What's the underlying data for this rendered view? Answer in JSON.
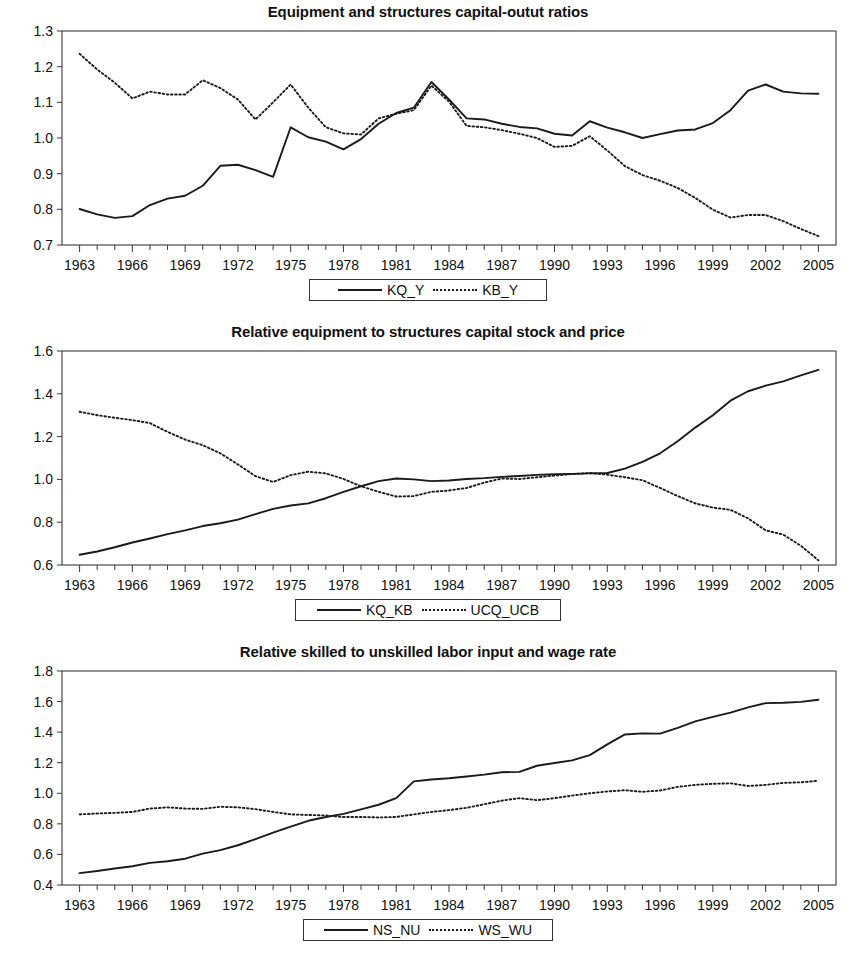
{
  "page": {
    "background": "#ffffff",
    "line_color": "#1a1a1a",
    "axis_color": "#3a3a3a"
  },
  "charts": [
    {
      "id": "chart-capital-output-ratios",
      "title": "Equipment and structures capital-outut ratios",
      "legend": [
        {
          "label": "KQ_Y",
          "style": "solid"
        },
        {
          "label": "KB_Y",
          "style": "dotted"
        }
      ],
      "y_ticks": [
        "0.7",
        "0.8",
        "0.9",
        "1.0",
        "1.1",
        "1.2",
        "1.3"
      ],
      "x_ticks": [
        "1963",
        "1966",
        "1969",
        "1972",
        "1975",
        "1978",
        "1981",
        "1984",
        "1987",
        "1990",
        "1993",
        "1996",
        "1999",
        "2002",
        "2005"
      ]
    },
    {
      "id": "chart-relative-capital-stock-price",
      "title": "Relative equipment to structures capital stock and price",
      "legend": [
        {
          "label": "KQ_KB",
          "style": "solid"
        },
        {
          "label": "UCQ_UCB",
          "style": "dotted"
        }
      ],
      "y_ticks": [
        "0.6",
        "0.8",
        "1.0",
        "1.2",
        "1.4",
        "1.6"
      ],
      "x_ticks": [
        "1963",
        "1966",
        "1969",
        "1972",
        "1975",
        "1978",
        "1981",
        "1984",
        "1987",
        "1990",
        "1993",
        "1996",
        "1999",
        "2002",
        "2005"
      ]
    },
    {
      "id": "chart-relative-labor-wage",
      "title": "Relative skilled to unskilled labor input and wage rate",
      "legend": [
        {
          "label": "NS_NU",
          "style": "solid"
        },
        {
          "label": "WS_WU",
          "style": "dotted"
        }
      ],
      "y_ticks": [
        "0.4",
        "0.6",
        "0.8",
        "1.0",
        "1.2",
        "1.4",
        "1.6",
        "1.8"
      ],
      "x_ticks": [
        "1963",
        "1966",
        "1969",
        "1972",
        "1975",
        "1978",
        "1981",
        "1984",
        "1987",
        "1990",
        "1993",
        "1996",
        "1999",
        "2002",
        "2005"
      ]
    }
  ],
  "chart_data": [
    {
      "type": "line",
      "title": "Equipment and structures capital-outut ratios",
      "xlabel": "",
      "ylabel": "",
      "xlim": [
        1962,
        2006
      ],
      "ylim": [
        0.7,
        1.3
      ],
      "grid": false,
      "legend_position": "bottom",
      "x": [
        1963,
        1964,
        1965,
        1966,
        1967,
        1968,
        1969,
        1970,
        1971,
        1972,
        1973,
        1974,
        1975,
        1976,
        1977,
        1978,
        1979,
        1980,
        1981,
        1982,
        1983,
        1984,
        1985,
        1986,
        1987,
        1988,
        1989,
        1990,
        1991,
        1992,
        1993,
        1994,
        1995,
        1996,
        1997,
        1998,
        1999,
        2000,
        2001,
        2002,
        2003,
        2004,
        2005
      ],
      "series": [
        {
          "name": "KQ_Y",
          "style": "solid",
          "values": [
            0.801,
            0.786,
            0.776,
            0.781,
            0.812,
            0.83,
            0.838,
            0.866,
            0.922,
            0.925,
            0.91,
            0.891,
            1.03,
            1.002,
            0.99,
            0.968,
            0.997,
            1.04,
            1.07,
            1.085,
            1.157,
            1.108,
            1.055,
            1.052,
            1.04,
            1.031,
            1.027,
            1.012,
            1.007,
            1.047,
            1.029,
            1.016,
            1.0,
            1.011,
            1.021,
            1.024,
            1.042,
            1.078,
            1.133,
            1.15,
            1.13,
            1.125,
            1.124
          ]
        },
        {
          "name": "KB_Y",
          "style": "dotted",
          "values": [
            1.236,
            1.192,
            1.155,
            1.111,
            1.13,
            1.122,
            1.122,
            1.162,
            1.14,
            1.108,
            1.052,
            1.1,
            1.15,
            1.085,
            1.03,
            1.013,
            1.01,
            1.055,
            1.068,
            1.078,
            1.147,
            1.102,
            1.034,
            1.03,
            1.022,
            1.012,
            1.0,
            0.975,
            0.978,
            1.005,
            0.965,
            0.921,
            0.896,
            0.88,
            0.86,
            0.832,
            0.799,
            0.777,
            0.784,
            0.784,
            0.767,
            0.745,
            0.725
          ]
        }
      ]
    },
    {
      "type": "line",
      "title": "Relative equipment to structures capital stock and price",
      "xlabel": "",
      "ylabel": "",
      "xlim": [
        1962,
        2006
      ],
      "ylim": [
        0.6,
        1.6
      ],
      "grid": false,
      "legend_position": "bottom",
      "x": [
        1963,
        1964,
        1965,
        1966,
        1967,
        1968,
        1969,
        1970,
        1971,
        1972,
        1973,
        1974,
        1975,
        1976,
        1977,
        1978,
        1979,
        1980,
        1981,
        1982,
        1983,
        1984,
        1985,
        1986,
        1987,
        1988,
        1989,
        1990,
        1991,
        1992,
        1993,
        1994,
        1995,
        1996,
        1997,
        1998,
        1999,
        2000,
        2001,
        2002,
        2003,
        2004,
        2005
      ],
      "series": [
        {
          "name": "KQ_KB",
          "style": "solid",
          "values": [
            0.648,
            0.663,
            0.683,
            0.705,
            0.724,
            0.744,
            0.762,
            0.782,
            0.795,
            0.812,
            0.838,
            0.862,
            0.878,
            0.888,
            0.912,
            0.942,
            0.968,
            0.992,
            1.004,
            1.0,
            0.992,
            0.995,
            1.002,
            1.006,
            1.012,
            1.016,
            1.021,
            1.024,
            1.026,
            1.028,
            1.03,
            1.05,
            1.082,
            1.122,
            1.178,
            1.242,
            1.3,
            1.368,
            1.412,
            1.438,
            1.458,
            1.486,
            1.512
          ]
        },
        {
          "name": "UCQ_UCB",
          "style": "dotted",
          "values": [
            1.316,
            1.3,
            1.288,
            1.277,
            1.263,
            1.222,
            1.186,
            1.16,
            1.122,
            1.07,
            1.015,
            0.988,
            1.02,
            1.036,
            1.028,
            1.002,
            0.968,
            0.942,
            0.92,
            0.922,
            0.942,
            0.948,
            0.96,
            0.985,
            1.004,
            1.002,
            1.01,
            1.018,
            1.025,
            1.03,
            1.022,
            1.01,
            0.996,
            0.96,
            0.922,
            0.888,
            0.868,
            0.858,
            0.818,
            0.762,
            0.742,
            0.69,
            0.622
          ]
        }
      ]
    },
    {
      "type": "line",
      "title": "Relative skilled to unskilled labor input and wage rate",
      "xlabel": "",
      "ylabel": "",
      "xlim": [
        1962,
        2006
      ],
      "ylim": [
        0.4,
        1.8
      ],
      "grid": false,
      "legend_position": "bottom",
      "x": [
        1963,
        1964,
        1965,
        1966,
        1967,
        1968,
        1969,
        1970,
        1971,
        1972,
        1973,
        1974,
        1975,
        1976,
        1977,
        1978,
        1979,
        1980,
        1981,
        1982,
        1983,
        1984,
        1985,
        1986,
        1987,
        1988,
        1989,
        1990,
        1991,
        1992,
        1993,
        1994,
        1995,
        1996,
        1997,
        1998,
        1999,
        2000,
        2001,
        2002,
        2003,
        2004,
        2005
      ],
      "series": [
        {
          "name": "NS_NU",
          "style": "solid",
          "values": [
            0.478,
            0.492,
            0.508,
            0.523,
            0.545,
            0.555,
            0.572,
            0.605,
            0.628,
            0.66,
            0.7,
            0.742,
            0.782,
            0.82,
            0.845,
            0.865,
            0.895,
            0.925,
            0.968,
            1.078,
            1.09,
            1.098,
            1.11,
            1.122,
            1.138,
            1.14,
            1.18,
            1.198,
            1.215,
            1.25,
            1.32,
            1.385,
            1.392,
            1.39,
            1.428,
            1.47,
            1.5,
            1.528,
            1.562,
            1.59,
            1.592,
            1.598,
            1.612
          ]
        },
        {
          "name": "WS_WU",
          "style": "dotted",
          "values": [
            0.862,
            0.868,
            0.872,
            0.878,
            0.9,
            0.908,
            0.9,
            0.898,
            0.912,
            0.908,
            0.896,
            0.878,
            0.862,
            0.858,
            0.855,
            0.845,
            0.845,
            0.842,
            0.845,
            0.862,
            0.878,
            0.89,
            0.905,
            0.928,
            0.952,
            0.968,
            0.955,
            0.968,
            0.985,
            1.0,
            1.012,
            1.02,
            1.01,
            1.018,
            1.042,
            1.055,
            1.062,
            1.065,
            1.048,
            1.055,
            1.068,
            1.072,
            1.082
          ]
        }
      ]
    }
  ]
}
